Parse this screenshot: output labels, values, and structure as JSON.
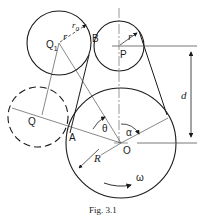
{
  "figure": {
    "caption": "Fig. 3.1",
    "labels": {
      "Q1": "Q",
      "Q1_sub": "1",
      "Q": "Q",
      "B": "B",
      "P": "P",
      "A": "A",
      "O": "O",
      "r0": "r",
      "r0_sub": "0",
      "r": "r",
      "r_small": "r",
      "d": "d",
      "theta": "θ",
      "alpha": "α",
      "R": "R",
      "omega": "ω"
    },
    "circles": [
      {
        "name": "circle-Q1",
        "cx": 59,
        "cy": 43,
        "r": 32,
        "style": "solid"
      },
      {
        "name": "circle-P",
        "cx": 119,
        "cy": 46,
        "r": 25,
        "style": "solid"
      },
      {
        "name": "circle-O",
        "cx": 121,
        "cy": 143,
        "r": 55,
        "style": "solid"
      },
      {
        "name": "circle-Q",
        "cx": 38,
        "cy": 117,
        "r": 30,
        "style": "dashed"
      }
    ],
    "colors": {
      "stroke": "#1a1a1a",
      "thin": "#555555",
      "background": "#ffffff"
    }
  }
}
